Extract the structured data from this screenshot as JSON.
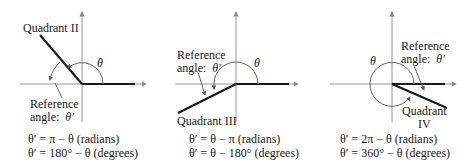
{
  "panels": [
    {
      "quadrant_label": "Quadrant II",
      "reference_label_line1": "Reference",
      "reference_label_line2": "angle:",
      "reference_symbol": "θ′",
      "theta_symbol": "θ",
      "formula_radians": "θ′ = π − θ (radians)",
      "formula_degrees": "θ′ = 180° − θ (degrees)"
    },
    {
      "quadrant_label": "Quadrant III",
      "reference_label_line1": "Reference",
      "reference_label_line2": "angle:",
      "reference_symbol": "θ′",
      "theta_symbol": "θ",
      "formula_radians": "θ′ = θ − π (radians)",
      "formula_degrees": "θ′ = θ − 180° (degrees)"
    },
    {
      "quadrant_label_line1": "Quadrant",
      "quadrant_label_line2": "IV",
      "reference_label_line1": "Reference",
      "reference_label_line2": "angle:",
      "reference_symbol": "θ′",
      "theta_symbol": "θ",
      "formula_radians": "θ′ = 2π − θ (radians)",
      "formula_degrees": "θ′ = 360° − θ (degrees)"
    }
  ],
  "colors": {
    "axis": "#8a8a8a",
    "terminal_side": "#1a1a1a",
    "arc": "#555555",
    "text": "#1a1a1a"
  }
}
